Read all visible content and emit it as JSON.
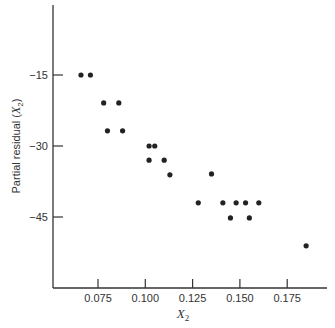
{
  "chart_data": {
    "type": "scatter",
    "title": "",
    "xlabel": "X2",
    "xlabel_main": "X",
    "xlabel_sub": "2",
    "ylabel": "Partial residual (X2)",
    "ylabel_main": "Partial residual (",
    "ylabel_var": "X",
    "ylabel_sub": "2",
    "ylabel_close": ")",
    "xlim": [
      0.053,
      0.19
    ],
    "ylim": [
      -58,
      0
    ],
    "grid": false,
    "legend": null,
    "x_ticks": [
      {
        "value": 0.075,
        "label": "0.075"
      },
      {
        "value": 0.1,
        "label": "0.100"
      },
      {
        "value": 0.125,
        "label": "0.125"
      },
      {
        "value": 0.15,
        "label": "0.150"
      },
      {
        "value": 0.175,
        "label": "0.175"
      }
    ],
    "y_ticks": [
      {
        "value": -15,
        "label": "−15"
      },
      {
        "value": -30,
        "label": "−30"
      },
      {
        "value": -45,
        "label": "−45"
      }
    ],
    "points": [
      {
        "x": 0.066,
        "y": -15.0
      },
      {
        "x": 0.071,
        "y": -15.0
      },
      {
        "x": 0.078,
        "y": -20.9
      },
      {
        "x": 0.086,
        "y": -20.9
      },
      {
        "x": 0.08,
        "y": -26.8
      },
      {
        "x": 0.088,
        "y": -26.8
      },
      {
        "x": 0.102,
        "y": -30.0
      },
      {
        "x": 0.105,
        "y": -30.0
      },
      {
        "x": 0.102,
        "y": -33.0
      },
      {
        "x": 0.11,
        "y": -33.0
      },
      {
        "x": 0.113,
        "y": -36.1
      },
      {
        "x": 0.135,
        "y": -35.9
      },
      {
        "x": 0.128,
        "y": -42.0
      },
      {
        "x": 0.141,
        "y": -42.0
      },
      {
        "x": 0.148,
        "y": -42.0
      },
      {
        "x": 0.153,
        "y": -42.0
      },
      {
        "x": 0.16,
        "y": -42.0
      },
      {
        "x": 0.145,
        "y": -45.2
      },
      {
        "x": 0.155,
        "y": -45.2
      },
      {
        "x": 0.185,
        "y": -51.1
      }
    ],
    "colors": {
      "axis": "#333333",
      "point": "#222222"
    }
  }
}
